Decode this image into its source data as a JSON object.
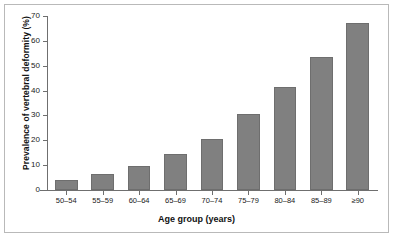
{
  "chart_data": {
    "type": "bar",
    "title": "",
    "xlabel": "Age group (years)",
    "ylabel": "Prevalence of vertebral deformity (%)",
    "categories": [
      "50–54",
      "55–59",
      "60–64",
      "65–69",
      "70–74",
      "75–79",
      "80–84",
      "85–89",
      "≥90"
    ],
    "values": [
      4.0,
      6.3,
      9.8,
      14.3,
      20.5,
      30.7,
      41.3,
      53.6,
      67.0
    ],
    "ylim": [
      0,
      70
    ],
    "yticks": [
      0,
      10,
      20,
      30,
      40,
      50,
      60,
      70
    ],
    "ytick_labels": [
      "0",
      "10",
      "20",
      "30",
      "40",
      "50",
      "60",
      "70"
    ],
    "grid": false,
    "legend": null,
    "bar_color": "#808080",
    "bar_edge_color": "#6e6e6e",
    "axis_color": "#6f6f6f",
    "frame_color": "#b9b9b9",
    "background": "#ffffff"
  }
}
